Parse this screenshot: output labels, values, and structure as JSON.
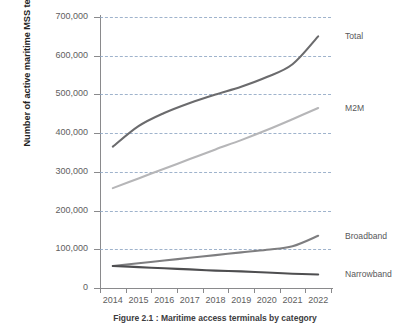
{
  "chart_data": {
    "type": "line",
    "title": "",
    "xlabel": "",
    "ylabel": "Number of active maritime MSS terminals by category",
    "categories": [
      "2014",
      "2015",
      "2016",
      "2017",
      "2018",
      "2019",
      "2020",
      "2021",
      "2022"
    ],
    "ylim": [
      0,
      700000
    ],
    "ytick_labels": [
      "0",
      "100,000",
      "200,000",
      "300,000",
      "400,000",
      "500,000",
      "600,000",
      "700,000"
    ],
    "ytick_values": [
      0,
      100000,
      200000,
      300000,
      400000,
      500000,
      600000,
      700000
    ],
    "grid": "horizontal-dashed",
    "legend_position": "right-inline",
    "series": [
      {
        "name": "Total",
        "color": "#6b6b6d",
        "values": [
          365000,
          418000,
          452000,
          478000,
          500000,
          520000,
          545000,
          578000,
          650000
        ]
      },
      {
        "name": "M2M",
        "color": "#b6b6b8",
        "values": [
          258000,
          283000,
          308000,
          333000,
          358000,
          382000,
          408000,
          436000,
          465000
        ]
      },
      {
        "name": "Broadband",
        "color": "#7e7e80",
        "values": [
          57000,
          64000,
          71000,
          78000,
          85000,
          92000,
          99000,
          108000,
          135000
        ]
      },
      {
        "name": "Narrowband",
        "color": "#4e4e50",
        "values": [
          57000,
          54000,
          51000,
          48000,
          45000,
          43000,
          40000,
          37000,
          35000
        ]
      }
    ]
  },
  "axis": {
    "y_title": "Number of active maritime MSS terminals by category"
  },
  "caption": {
    "text": "Figure 2.1 : Maritime access terminals by category"
  }
}
